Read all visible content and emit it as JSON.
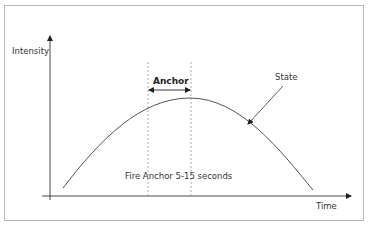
{
  "diagram": {
    "y_axis_label": "Intensity",
    "x_axis_label": "Time",
    "curve_label": "State",
    "anchor_label": "Anchor",
    "fire_label": "Fire Anchor 5-15 seconds",
    "colors": {
      "axis": "#333333",
      "curve": "#555555",
      "dashed": "#999999",
      "frame": "#b8b8b8"
    }
  }
}
